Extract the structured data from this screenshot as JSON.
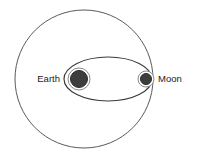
{
  "diagram": {
    "background_color": "#ffffff",
    "canvas": {
      "width": 197,
      "height": 156
    },
    "labels": {
      "earth": "Earth",
      "moon": "Moon"
    },
    "shapes": {
      "outer_circle": {
        "name": "large-circle",
        "cx": 84,
        "cy": 79,
        "r": 69,
        "stroke": "#5a5a5a",
        "fill": "none"
      },
      "orbit_ellipse": {
        "name": "moon-orbit-ellipse",
        "cx": 108,
        "cy": 79,
        "rx": 44,
        "ry": 22,
        "stroke": "#3a3a3a",
        "fill": "none"
      },
      "earth": {
        "name": "earth-body",
        "cx": 79,
        "cy": 79,
        "r": 8.5,
        "ring_r": 11,
        "fill": "#3d3d3d",
        "ring_stroke": "#8a8a8a"
      },
      "moon": {
        "name": "moon-body",
        "cx": 146,
        "cy": 79,
        "r": 5.5,
        "ring_r": 8,
        "fill": "#3d3d3d",
        "ring_stroke": "#8a8a8a"
      }
    },
    "label_positions": {
      "earth": {
        "x": 60,
        "y": 79
      },
      "moon": {
        "x": 158,
        "y": 79
      }
    }
  }
}
